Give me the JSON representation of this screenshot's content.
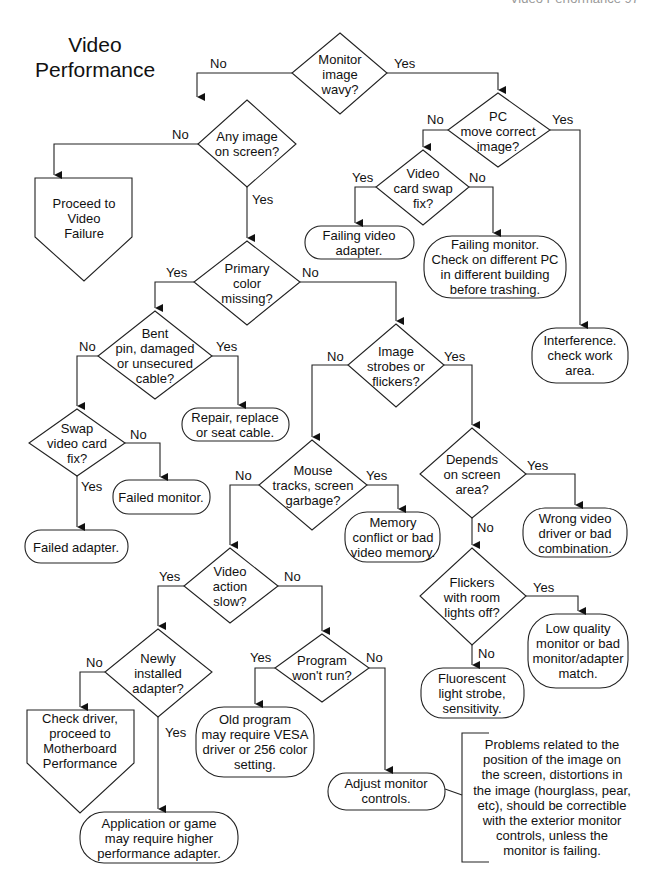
{
  "header": {
    "running_head": "Video Performance  97"
  },
  "title": "Video\nPerformance",
  "edge_labels": {
    "yes": "Yes",
    "no": "No"
  },
  "nodes": {
    "monitor_wavy": "Monitor\nimage\nwavy?",
    "any_image": "Any image\non screen?",
    "proceed_video_failure": "Proceed to\nVideo\nFailure",
    "pc_move": "PC\nmove correct\nimage?",
    "card_swap_fix": "Video\ncard swap\nfix?",
    "failing_adapter": "Failing video\nadapter.",
    "failing_monitor": "Failing monitor.\nCheck on different PC\nin different building\nbefore trashing.",
    "interference": "Interference.\ncheck work\narea.",
    "primary_color": "Primary\ncolor\nmissing?",
    "bent_pin": "Bent\npin, damaged\nor unsecured\ncable?",
    "repair_cable": "Repair, replace\nor seat cable.",
    "swap_video_card": "Swap\nvideo card\nfix?",
    "failed_monitor": "Failed monitor.",
    "failed_adapter": "Failed adapter.",
    "image_strobes": "Image\nstrobes or\nflickers?",
    "mouse_tracks": "Mouse\ntracks, screen\ngarbage?",
    "memory_conflict": "Memory\nconflict or bad\nvideo memory.",
    "depends_area": "Depends\non screen\narea?",
    "wrong_driver": "Wrong video\ndriver or bad\ncombination.",
    "flickers_lights": "Flickers\nwith room\nlights off?",
    "low_quality": "Low quality\nmonitor or bad\nmonitor/adapter\nmatch.",
    "fluorescent": "Fluorescent\nlight strobe,\nsensitivity.",
    "video_slow": "Video\naction\nslow?",
    "newly_installed": "Newly\ninstalled\nadapter?",
    "check_driver": "Check driver,\nproceed to\nMotherboard\nPerformance",
    "program_wont_run": "Program\nwon't run?",
    "old_program": "Old program\nmay require VESA\ndriver or 256 color\nsetting.",
    "adjust_controls": "Adjust monitor\ncontrols.",
    "app_game": "Application or game\nmay require higher\nperformance adapter."
  },
  "annotation": "Problems related to the\nposition of the image on\nthe screen, distortions in\nthe image (hourglass, pear,\netc), should be correctible\nwith the exterior monitor\ncontrols, unless the\nmonitor is failing."
}
